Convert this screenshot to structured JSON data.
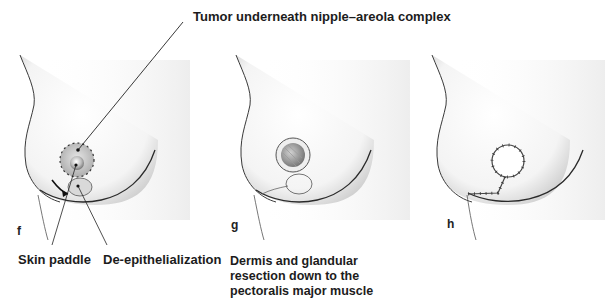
{
  "figure": {
    "callout_top": "Tumor underneath nipple–areola complex",
    "panels": [
      {
        "letter": "f",
        "labels": [
          "Skin paddle",
          "De-epithelialization"
        ]
      },
      {
        "letter": "g",
        "caption_lines": [
          "Dermis and glandular",
          "resection down to the",
          "pectoralis major muscle"
        ]
      },
      {
        "letter": "h"
      }
    ]
  }
}
